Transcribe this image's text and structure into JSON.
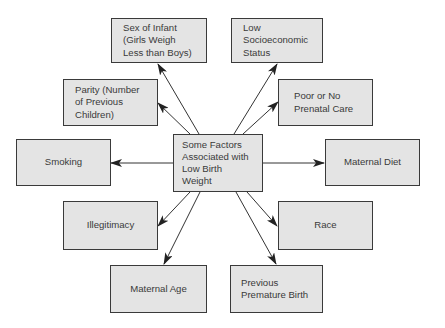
{
  "diagram": {
    "center": {
      "label": "Some Factors\nAssociated with\nLow Birth\nWeight"
    },
    "factors": [
      {
        "id": "sex",
        "label": "Sex of Infant\n(Girls Weigh\nLess than Boys)"
      },
      {
        "id": "ses",
        "label": "Low\nSocioeconomic\nStatus"
      },
      {
        "id": "parity",
        "label": "Parity (Number\nof Previous\nChildren)"
      },
      {
        "id": "prenatal",
        "label": "Poor or No\nPrenatal Care"
      },
      {
        "id": "smoking",
        "label": "Smoking"
      },
      {
        "id": "diet",
        "label": "Maternal Diet"
      },
      {
        "id": "illegitimacy",
        "label": "Illegitimacy"
      },
      {
        "id": "race",
        "label": "Race"
      },
      {
        "id": "age",
        "label": "Maternal Age"
      },
      {
        "id": "premature",
        "label": "Previous\nPremature Birth"
      }
    ],
    "edges": [
      {
        "from": "center",
        "to": "sex"
      },
      {
        "from": "center",
        "to": "ses"
      },
      {
        "from": "center",
        "to": "parity"
      },
      {
        "from": "center",
        "to": "prenatal"
      },
      {
        "from": "center",
        "to": "smoking"
      },
      {
        "from": "center",
        "to": "diet"
      },
      {
        "from": "center",
        "to": "illegitimacy"
      },
      {
        "from": "center",
        "to": "race"
      },
      {
        "from": "center",
        "to": "age"
      },
      {
        "from": "center",
        "to": "premature"
      }
    ],
    "colors": {
      "box_fill": "#e4e4e4",
      "stroke": "#3a3a3a",
      "background": "#ffffff"
    }
  }
}
